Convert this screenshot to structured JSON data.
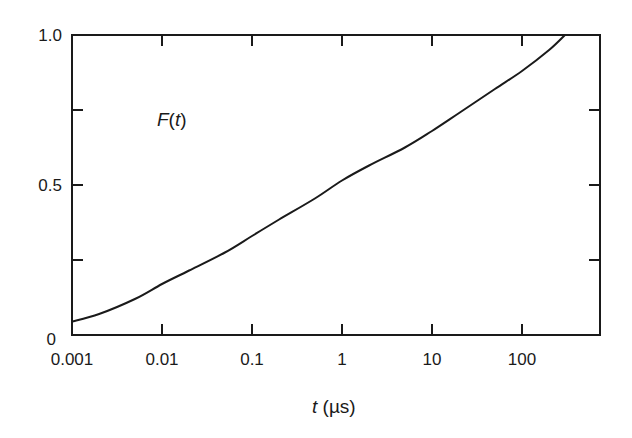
{
  "chart_data": {
    "type": "line",
    "title": "",
    "series_label": "F(t)",
    "series_label_parts": {
      "func": "F",
      "open": "(",
      "var": "t",
      "close": ")"
    },
    "xlabel": "t (µs)",
    "xlabel_parts": {
      "var": "t",
      "unit": " (µs)"
    },
    "ylabel": "",
    "xscale": "log",
    "xlim": [
      0.001,
      700
    ],
    "ylim": [
      0,
      1.0
    ],
    "x_ticks": [
      0.001,
      0.01,
      0.1,
      1,
      10,
      100
    ],
    "x_tick_labels": [
      "0.001",
      "0.01",
      "0.1",
      "1",
      "10",
      "100"
    ],
    "y_ticks": [
      0,
      0.25,
      0.5,
      0.75,
      1.0
    ],
    "y_tick_labels": [
      "0",
      "",
      "0.5",
      "",
      "1.0"
    ],
    "grid": false,
    "legend": "none",
    "series": [
      {
        "name": "F(t)",
        "color": "#1a1a1a",
        "x": [
          0.001,
          0.002,
          0.005,
          0.01,
          0.02,
          0.05,
          0.1,
          0.2,
          0.5,
          1,
          2,
          5,
          10,
          20,
          50,
          100,
          200,
          300
        ],
        "values": [
          0.045,
          0.07,
          0.12,
          0.17,
          0.215,
          0.275,
          0.33,
          0.385,
          0.455,
          0.515,
          0.565,
          0.625,
          0.68,
          0.74,
          0.82,
          0.88,
          0.95,
          1.0
        ]
      }
    ]
  }
}
